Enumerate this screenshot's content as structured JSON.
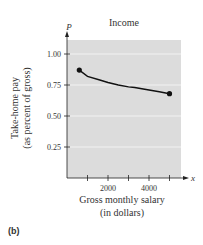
{
  "chart_data": {
    "type": "line",
    "title": "Income",
    "xlabel": "Gross monthly salary\n(in dollars)",
    "xlabel_lines": [
      "Gross monthly salary",
      "(in dollars)"
    ],
    "ylabel_lines": [
      "Take-home pay",
      "(as percent of gross)"
    ],
    "x_axis_var": "x",
    "y_axis_var": "P",
    "xlim": [
      0,
      5500
    ],
    "ylim": [
      0,
      1.1
    ],
    "x_ticks": [
      1000,
      2000,
      3000,
      4000,
      5000
    ],
    "x_tick_labels": [
      "",
      "2000",
      "",
      "4000",
      ""
    ],
    "y_ticks": [
      0.25,
      0.5,
      0.75,
      1.0
    ],
    "y_tick_labels": [
      "0.25",
      "0.50",
      "0.75",
      "1.00"
    ],
    "grid": "horizontal",
    "series": [
      {
        "name": "Take-home pay",
        "x": [
          600,
          1000,
          1600,
          2000,
          2500,
          3000,
          3300,
          4000,
          4500,
          5000
        ],
        "values": [
          0.87,
          0.82,
          0.79,
          0.77,
          0.75,
          0.735,
          0.73,
          0.71,
          0.695,
          0.68
        ],
        "endpoints": [
          [
            600,
            0.87
          ],
          [
            5000,
            0.68
          ]
        ]
      }
    ],
    "legend": "none"
  },
  "panel_label": "(b)",
  "colors": {
    "plot_background": "#dcdcdc",
    "gridline": "#f2f2f2",
    "curve": "#111111",
    "axis": "#222222"
  }
}
